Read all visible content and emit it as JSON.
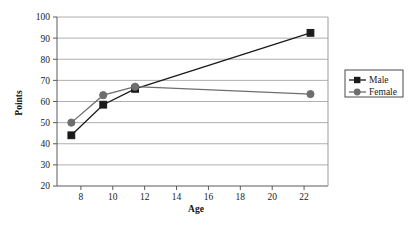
{
  "chart_data": {
    "type": "line",
    "title": "",
    "xlabel": "Age",
    "ylabel": "Points",
    "xlim": [
      6.5,
      23.5
    ],
    "ylim": [
      20,
      100
    ],
    "xticks": [
      8,
      10,
      12,
      14,
      16,
      18,
      20,
      22
    ],
    "yticks": [
      20,
      30,
      40,
      50,
      60,
      70,
      80,
      90,
      100
    ],
    "grid": "horizontal",
    "legend_position": "right",
    "series": [
      {
        "name": "Male",
        "marker": "square",
        "color": "#1a1a1a",
        "x": [
          7.4,
          9.4,
          11.4,
          22.4
        ],
        "values": [
          44,
          58.5,
          66,
          92.5
        ]
      },
      {
        "name": "Female",
        "marker": "circle",
        "color": "#6e6e6e",
        "x": [
          7.4,
          9.4,
          11.4,
          22.4
        ],
        "values": [
          50,
          63,
          67,
          63.5
        ]
      }
    ]
  },
  "axes": {
    "y_title": "Points",
    "x_title": "Age",
    "y_tick_labels": [
      "20",
      "30",
      "40",
      "50",
      "60",
      "70",
      "80",
      "90",
      "100"
    ],
    "x_tick_labels": [
      "8",
      "10",
      "12",
      "14",
      "16",
      "18",
      "20",
      "22"
    ]
  },
  "legend": {
    "items": [
      {
        "label": "Male",
        "marker": "square-marker",
        "color": "#1a1a1a"
      },
      {
        "label": "Female",
        "marker": "circle-marker",
        "color": "#6e6e6e"
      }
    ]
  },
  "colors": {
    "male": "#1a1a1a",
    "female": "#6e6e6e",
    "grid": "#9a9a9a",
    "axis": "#5a5a5a",
    "background": "#ffffff"
  }
}
